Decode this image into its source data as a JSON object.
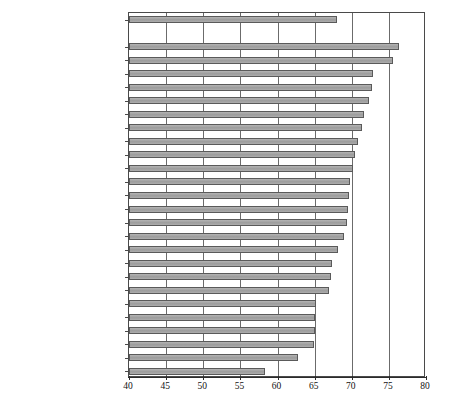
{
  "chart_data": {
    "type": "bar",
    "orientation": "horizontal",
    "title": "",
    "subtitle": "",
    "xlabel": "",
    "ylabel": "",
    "xlim": [
      40,
      80
    ],
    "xticks": [
      40,
      45,
      50,
      55,
      60,
      65,
      70,
      75,
      80
    ],
    "xticklabels": [
      "40",
      "45",
      "50",
      "55",
      "60",
      "65",
      "70",
      "75",
      "80"
    ],
    "grid": "vertical",
    "legend": "none",
    "bar_color": "#a8a8a8",
    "bar_edge_color": "#5a5a5a",
    "categories": [
      "Sweden",
      "Östersund",
      "Luleå/Boden",
      "Växjö",
      "Umeå",
      "Borås",
      "Sundsvall",
      "Stockholm/Södertälje",
      "Kalmar/Nybro",
      "Trollhättan/Vänersborg",
      "Gävle/Sandviken",
      "Uppsala",
      "Västerås",
      "Borlänge/Falun",
      "Halmstad",
      "Jönköping",
      "Eskilstuna",
      "Uddevalla",
      "Kristianstad",
      "Norrköping",
      "Gothenburg",
      "Linköping",
      "Karlstad",
      "Örebro",
      "Helsingborg/Landskrona",
      "Malmö/Lund/Trelleborg"
    ],
    "values": [
      68.0,
      76.3,
      75.6,
      72.9,
      72.7,
      72.3,
      71.6,
      71.4,
      70.8,
      70.5,
      70.2,
      69.8,
      69.6,
      69.5,
      69.3,
      69.0,
      68.2,
      67.4,
      67.2,
      66.9,
      65.2,
      65.0,
      65.0,
      64.9,
      62.8,
      58.3
    ],
    "separator_after_index": 0
  },
  "caption": {
    "text": ""
  }
}
